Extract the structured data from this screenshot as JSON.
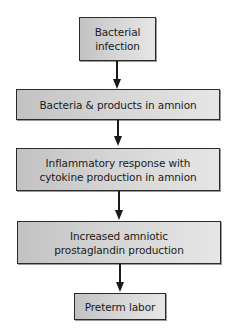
{
  "diagram": {
    "type": "flowchart",
    "direction": "top-to-bottom",
    "colors": {
      "box_border": "#2a2a2a",
      "box_fill_left": "#c2c2c2",
      "box_fill_right": "#e6e6e6",
      "arrow": "#1a1a1a",
      "text": "#1a1a1a",
      "background": "#ffffff"
    },
    "nodes": [
      {
        "id": "n1",
        "lines": [
          "Bacterial",
          "infection"
        ]
      },
      {
        "id": "n2",
        "lines": [
          "Bacteria & products in amnion"
        ]
      },
      {
        "id": "n3",
        "lines": [
          "Inflammatory response with",
          "cytokine production in amnion"
        ]
      },
      {
        "id": "n4",
        "lines": [
          "Increased amniotic",
          "prostaglandin production"
        ]
      },
      {
        "id": "n5",
        "lines": [
          "Preterm labor"
        ]
      }
    ],
    "edges": [
      {
        "from": "n1",
        "to": "n2"
      },
      {
        "from": "n2",
        "to": "n3"
      },
      {
        "from": "n3",
        "to": "n4"
      },
      {
        "from": "n4",
        "to": "n5"
      }
    ]
  }
}
